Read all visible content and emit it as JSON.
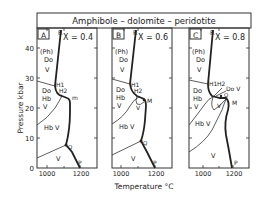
{
  "title": "Amphibole  –  dolomite  –  peridotite",
  "title_parts": [
    "Amphibole",
    "–",
    "dolomite",
    "–",
    "peridotite"
  ],
  "axes": {
    "y_label": "Pressure kbar",
    "x_label": "Temperature °C",
    "y_ticks": [
      "0",
      "10",
      "20",
      "30",
      "40"
    ],
    "x_ticks": [
      "1000",
      "1200"
    ]
  },
  "panels": [
    {
      "id": "A",
      "composition": "X = 0.4",
      "labels": {
        "R": "R",
        "Ph": "(Ph)",
        "Do_top": "Do",
        "V_top": "V",
        "H1": "H1",
        "H2": "H2",
        "m": "m",
        "Do_mid": "Do",
        "Hb_mid": "Hb",
        "V_mid": "V",
        "HbV": "Hb V",
        "Q": "Q",
        "V_bot": "V",
        "P": "P"
      }
    },
    {
      "id": "B",
      "composition": "X = 0.6",
      "labels": {
        "R": "R",
        "Ph": "(Ph)",
        "Do_top": "Do",
        "V_top": "V",
        "H1": "H1",
        "H2": "H2",
        "M": "M",
        "Do_mid": "Do",
        "Hb_mid": "Hb",
        "V_mid": "V",
        "V_small": "V",
        "HbV": "Hb V",
        "Q": "Q",
        "V_bot": "V",
        "P": "P"
      }
    },
    {
      "id": "C",
      "composition": "X = 0.8",
      "labels": {
        "R": "R",
        "Ph": "(Ph)",
        "Do_top": "Do",
        "V_top": "V",
        "H1": "H1",
        "H2": "H2",
        "DoV": "Do V",
        "Q": "Q",
        "M": "M",
        "Do_mid": "Do",
        "Hb_mid": "Hb",
        "V_mid": "V",
        "V_small": "V",
        "HbV": "Hb V",
        "V_bot": "V",
        "P": "P"
      }
    }
  ]
}
